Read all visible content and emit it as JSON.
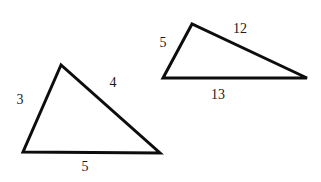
{
  "figure": {
    "background_color": "#ffffff",
    "stroke_color": "#0d0d0d",
    "label_color": "#1a1a1a",
    "width": 321,
    "height": 182,
    "triangles": [
      {
        "name": "small-triangle",
        "side_lengths": [
          "3",
          "4",
          "5"
        ],
        "vertices": [
          [
            61,
            65
          ],
          [
            23,
            152
          ],
          [
            160,
            153
          ]
        ],
        "labels": [
          {
            "text": "3",
            "x": 20,
            "y": 100,
            "side": "left-leg"
          },
          {
            "text": "4",
            "x": 113,
            "y": 83,
            "side": "hypotenuse"
          },
          {
            "text": "5",
            "x": 85,
            "y": 167,
            "side": "base"
          }
        ]
      },
      {
        "name": "large-triangle",
        "side_lengths": [
          "5",
          "12",
          "13"
        ],
        "vertices": [
          [
            192,
            24
          ],
          [
            163,
            78
          ],
          [
            307,
            78
          ]
        ],
        "labels": [
          {
            "text": "5",
            "x": 163,
            "y": 43,
            "side": "left-leg"
          },
          {
            "text": "12",
            "x": 240,
            "y": 29,
            "side": "hypotenuse"
          },
          {
            "text": "13",
            "x": 218,
            "y": 95,
            "side": "base"
          }
        ]
      }
    ]
  }
}
